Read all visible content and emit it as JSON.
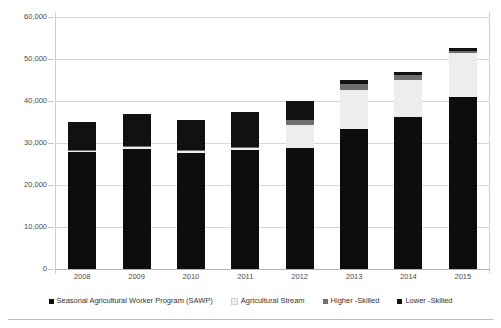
{
  "chart_data": {
    "type": "bar",
    "subtype": "stacked-column",
    "title": "",
    "subtitle": "",
    "xlabel": "",
    "ylabel": "",
    "categories": [
      "2008",
      "2009",
      "2010",
      "2011",
      "2012",
      "2013",
      "2014",
      "2015"
    ],
    "ylim": [
      0,
      60000
    ],
    "ytick_values": [
      0,
      10000,
      20000,
      30000,
      40000,
      50000,
      60000
    ],
    "ytick_labels": [
      "0",
      "10,000",
      "20,000",
      "30,000",
      "40,000",
      "50,000",
      "60,000"
    ],
    "grid": true,
    "grid_axis": "y",
    "legend_position": "bottom",
    "stack_order_bottom_to_top": [
      "Seasonal Agricultural Worker Program (SAWP)",
      "Agricultural Stream",
      "Higher -Skilled",
      "Lower -Skilled"
    ],
    "series": [
      {
        "name": "Seasonal Agricultural Worker Program (SAWP)",
        "color": "#0d0d0d",
        "values": [
          27800,
          28600,
          27700,
          28300,
          28700,
          33400,
          36100,
          41000
        ]
      },
      {
        "name": "Agricultural Stream",
        "color": "#ededed",
        "values": [
          300,
          400,
          400,
          500,
          5500,
          9300,
          9000,
          10400
        ]
      },
      {
        "name": "Higher -Skilled",
        "color": "#6e6e6e",
        "values": [
          200,
          200,
          200,
          300,
          1300,
          1400,
          1100,
          600
        ]
      },
      {
        "name": "Lower -Skilled",
        "color": "#111111",
        "values": [
          6700,
          7800,
          7200,
          8400,
          4500,
          800,
          800,
          600
        ]
      }
    ],
    "totals": [
      35000,
      37000,
      35500,
      37500,
      40000,
      44900,
      47000,
      52600
    ]
  },
  "legend": {
    "items": [
      {
        "label": "Seasonal Agricultural Worker Program (SAWP)",
        "color": "#0d0d0d"
      },
      {
        "label": "Agricultural Stream",
        "color": "#ededed"
      },
      {
        "label": "Higher -Skilled",
        "color": "#6e6e6e"
      },
      {
        "label": "Lower -Skilled",
        "color": "#111111"
      }
    ]
  },
  "colors": {
    "gridline": "#d8d8d8",
    "axis": "#b4b4b4",
    "text": "#4a4a4a",
    "background": "#ffffff"
  }
}
